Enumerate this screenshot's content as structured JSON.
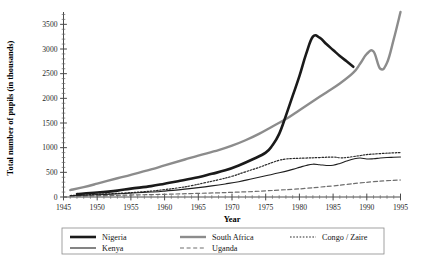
{
  "chart_data": {
    "type": "line",
    "title": "",
    "xlabel": "Year",
    "ylabel": "Total number of pupils (in thousands)",
    "xlim": [
      1945,
      1995
    ],
    "ylim": [
      0,
      3750
    ],
    "xticks": [
      1945,
      1950,
      1955,
      1960,
      1965,
      1970,
      1975,
      1980,
      1985,
      1990,
      1995
    ],
    "yticks": [
      0,
      500,
      1000,
      1500,
      2000,
      2500,
      3000,
      3500
    ],
    "y_minor_step": 100,
    "x_minor_step": 1,
    "grid": false,
    "legend_position": "below",
    "series": [
      {
        "name": "Nigeria",
        "style": "thick-solid-black",
        "color": "#1a1a1a",
        "width": 2.6,
        "dash": "",
        "x": [
          1947,
          1950,
          1953,
          1955,
          1958,
          1960,
          1962,
          1965,
          1967,
          1969,
          1971,
          1973,
          1975,
          1976,
          1977,
          1978,
          1979,
          1980,
          1981,
          1982,
          1983,
          1984,
          1985,
          1986,
          1987,
          1988
        ],
        "y": [
          60,
          90,
          130,
          170,
          220,
          270,
          320,
          400,
          470,
          540,
          640,
          760,
          900,
          1050,
          1280,
          1650,
          2050,
          2450,
          2900,
          3250,
          3230,
          3100,
          2980,
          2860,
          2750,
          2640
        ]
      },
      {
        "name": "South Africa",
        "style": "medium-solid-gray",
        "color": "#8c8c8c",
        "width": 2.4,
        "dash": "",
        "x": [
          1946,
          1948,
          1950,
          1953,
          1955,
          1958,
          1960,
          1963,
          1965,
          1968,
          1970,
          1972,
          1974,
          1976,
          1978,
          1980,
          1982,
          1984,
          1986,
          1988,
          1989,
          1990,
          1991,
          1992,
          1993,
          1994,
          1995
        ],
        "y": [
          140,
          200,
          270,
          380,
          450,
          560,
          640,
          760,
          840,
          950,
          1040,
          1150,
          1280,
          1430,
          1580,
          1760,
          1940,
          2120,
          2300,
          2520,
          2700,
          2900,
          2950,
          2600,
          2720,
          3200,
          3750
        ]
      },
      {
        "name": "Congo / Zaire",
        "style": "fine-dotted-black",
        "color": "#2a2a2a",
        "width": 1.2,
        "dash": "1.6,1.6",
        "x": [
          1946,
          1950,
          1954,
          1958,
          1960,
          1962,
          1964,
          1966,
          1968,
          1970,
          1972,
          1974,
          1975,
          1976,
          1977,
          1978,
          1979,
          1981,
          1983,
          1985,
          1986,
          1987,
          1988,
          1989,
          1990,
          1992,
          1994,
          1995
        ],
        "y": [
          30,
          55,
          80,
          120,
          150,
          185,
          230,
          290,
          350,
          420,
          510,
          600,
          650,
          700,
          745,
          770,
          780,
          790,
          800,
          810,
          795,
          800,
          820,
          840,
          860,
          880,
          895,
          900
        ]
      },
      {
        "name": "Kenya",
        "style": "thin-solid-black",
        "color": "#1f1f1f",
        "width": 1.1,
        "dash": "",
        "x": [
          1946,
          1950,
          1954,
          1958,
          1960,
          1963,
          1965,
          1967,
          1969,
          1971,
          1973,
          1975,
          1977,
          1979,
          1980,
          1981,
          1982,
          1983,
          1984,
          1985,
          1986,
          1987,
          1988,
          1989,
          1990,
          1991,
          1992,
          1993,
          1994,
          1995
        ],
        "y": [
          25,
          45,
          70,
          100,
          120,
          160,
          190,
          225,
          265,
          310,
          370,
          430,
          490,
          560,
          600,
          640,
          665,
          655,
          640,
          645,
          680,
          730,
          770,
          790,
          770,
          775,
          790,
          800,
          805,
          810
        ]
      },
      {
        "name": "Uganda",
        "style": "dashed-gray",
        "color": "#6e6e6e",
        "width": 1.2,
        "dash": "4,2.6",
        "x": [
          1946,
          1950,
          1955,
          1960,
          1964,
          1968,
          1970,
          1973,
          1975,
          1977,
          1979,
          1981,
          1983,
          1985,
          1987,
          1989,
          1991,
          1993,
          1995
        ],
        "y": [
          15,
          25,
          40,
          55,
          70,
          85,
          95,
          110,
          125,
          140,
          155,
          175,
          200,
          225,
          255,
          285,
          310,
          330,
          345
        ]
      }
    ]
  },
  "legend": {
    "entries": [
      {
        "label": "Nigeria",
        "series": "Nigeria"
      },
      {
        "label": "Kenya",
        "series": "Kenya"
      },
      {
        "label": "South Africa",
        "series": "South Africa"
      },
      {
        "label": "Uganda",
        "series": "Uganda"
      },
      {
        "label": "Congo / Zaire",
        "series": "Congo / Zaire"
      }
    ]
  },
  "colors": {
    "nigeria": "#1a1a1a",
    "south_africa": "#8c8c8c",
    "kenya": "#1f1f1f",
    "uganda": "#6e6e6e",
    "congo_zaire": "#2a2a2a",
    "axis": "#4a4a4a",
    "legend_border": "#8a8a8a",
    "background": "#ffffff"
  }
}
